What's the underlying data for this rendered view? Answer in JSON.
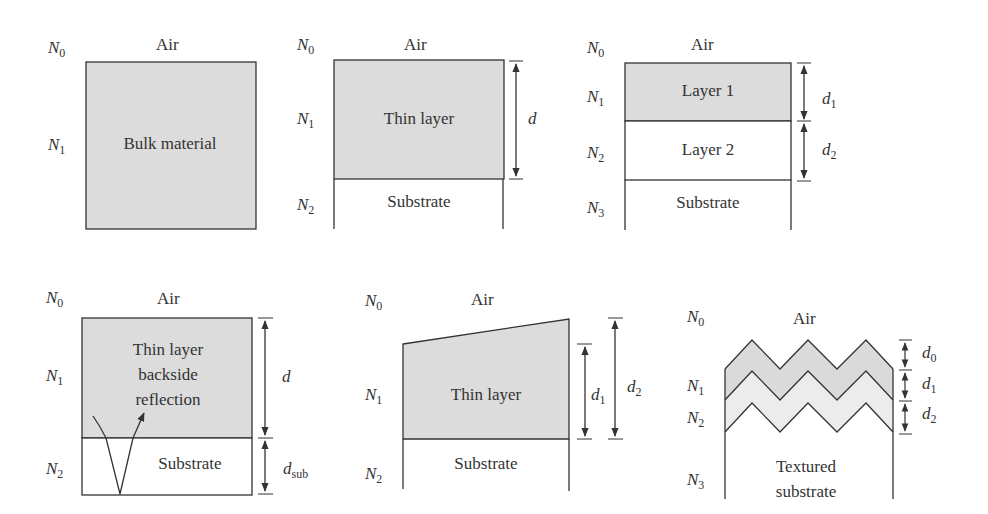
{
  "colors": {
    "fill_dark": "#dcdcdc",
    "fill_light": "#ececec",
    "stroke": "#333333",
    "background": "#ffffff"
  },
  "panels": [
    {
      "id": "bulk",
      "index_labels": [
        "N",
        "N"
      ],
      "index_subs": [
        "0",
        "1"
      ],
      "medium_top": "Air",
      "regions": [
        "Bulk material"
      ]
    },
    {
      "id": "thin-layer",
      "index_subs": [
        "0",
        "1",
        "2"
      ],
      "medium_top": "Air",
      "regions": [
        "Thin layer",
        "Substrate"
      ],
      "thickness": {
        "main": "d"
      }
    },
    {
      "id": "two-layers",
      "index_subs": [
        "0",
        "1",
        "2",
        "3"
      ],
      "medium_top": "Air",
      "regions": [
        "Layer 1",
        "Layer 2",
        "Substrate"
      ],
      "thickness": {
        "d1_base": "d",
        "d1_sub": "1",
        "d2_base": "d",
        "d2_sub": "2"
      }
    },
    {
      "id": "backside",
      "index_subs": [
        "0",
        "1",
        "2"
      ],
      "medium_top": "Air",
      "regions": [
        "Thin layer",
        "backside",
        "reflection",
        "Substrate"
      ],
      "thickness": {
        "main": "d",
        "sub_base": "d",
        "sub_sub": "sub"
      }
    },
    {
      "id": "wedge",
      "index_subs": [
        "0",
        "1",
        "2"
      ],
      "medium_top": "Air",
      "regions": [
        "Thin layer",
        "Substrate"
      ],
      "thickness": {
        "d1_base": "d",
        "d1_sub": "1",
        "d2_base": "d",
        "d2_sub": "2"
      }
    },
    {
      "id": "textured",
      "index_subs": [
        "0",
        "1",
        "2",
        "3"
      ],
      "medium_top": "Air",
      "regions": [
        "Textured",
        "substrate"
      ],
      "thickness": {
        "d0_base": "d",
        "d0_sub": "0",
        "d1_base": "d",
        "d1_sub": "1",
        "d2_base": "d",
        "d2_sub": "2"
      }
    }
  ],
  "N": "N"
}
